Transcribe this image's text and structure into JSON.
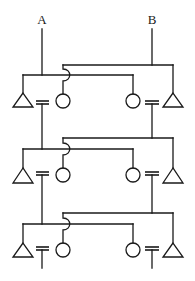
{
  "diagram": {
    "type": "ladder network schematic",
    "terminals": [
      {
        "id": "A",
        "label": "A",
        "x": 42
      },
      {
        "id": "B",
        "label": "B",
        "x": 152
      }
    ],
    "stages": [
      {
        "index": 1,
        "upper_bus_y": 65,
        "lower_bus_y": 75,
        "apex_y": 93,
        "base_y": 107,
        "plate_y": [
          101,
          104
        ],
        "circle_cy": 101,
        "stem_end": 138,
        "a_stem_end": 149
      },
      {
        "index": 2,
        "upper_bus_y": 138,
        "lower_bus_y": 149,
        "apex_y": 168,
        "base_y": 183,
        "plate_y": [
          172,
          175
        ],
        "circle_cy": 175,
        "stem_end": 213,
        "a_stem_end": 224
      },
      {
        "index": 3,
        "upper_bus_y": 213,
        "lower_bus_y": 224,
        "apex_y": 243,
        "base_y": 257,
        "plate_y": [
          247,
          250
        ],
        "circle_cy": 250,
        "stem_end": 268,
        "a_stem_end": 268
      }
    ],
    "elements_per_stage": [
      "triangle-left",
      "capacitor-left",
      "circle-left",
      "circle-right",
      "capacitor-right",
      "triangle-right",
      "wire-crossover-hop"
    ],
    "stroke_color": "#1a1a1a",
    "background": "#ffffff"
  }
}
